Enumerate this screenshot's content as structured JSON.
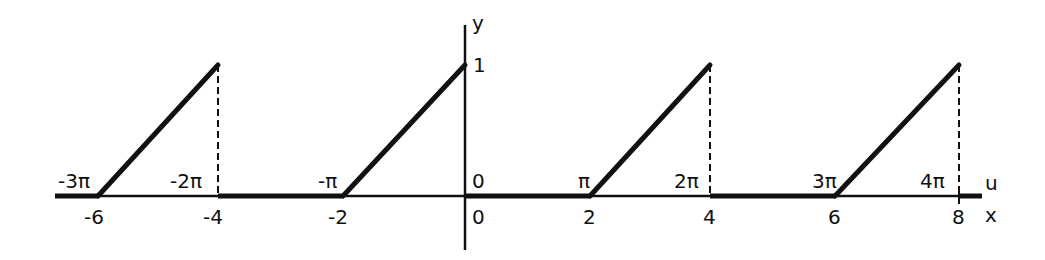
{
  "diagram": {
    "axis_labels": {
      "y": "y",
      "u": "u",
      "x": "x"
    },
    "y_tick": "1",
    "origin_top": "0",
    "origin_bottom": "0",
    "u_ticks": [
      "-3π",
      "-2π",
      "-π",
      "π",
      "2π",
      "3π",
      "4π"
    ],
    "x_ticks": [
      "-6",
      "-4",
      "-2",
      "2",
      "4",
      "6",
      "8"
    ],
    "ramps": [
      {
        "x_start": -6,
        "x_end": -4
      },
      {
        "x_start": -2,
        "x_end": 0
      },
      {
        "x_start": 2,
        "x_end": 4
      },
      {
        "x_start": 6,
        "x_end": 8
      }
    ],
    "colors": {
      "ink": "#111111",
      "background": "#ffffff"
    }
  }
}
